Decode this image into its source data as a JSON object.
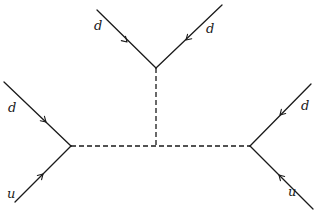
{
  "diagram": {
    "vertices": {
      "left": {
        "x": 71,
        "y": 146
      },
      "right": {
        "x": 250,
        "y": 146
      },
      "top": {
        "x": 156,
        "y": 68
      },
      "junction": {
        "x": 156,
        "y": 146
      }
    },
    "external_lines": [
      {
        "id": "left-upper",
        "label": "d",
        "from": [
          4,
          82
        ],
        "to": [
          71,
          146
        ],
        "label_pos": [
          8,
          112
        ],
        "arrow_at": [
          46,
          122
        ],
        "direction": "in"
      },
      {
        "id": "left-lower",
        "label": "u",
        "from": [
          15,
          202
        ],
        "to": [
          71,
          146
        ],
        "label_pos": [
          7,
          198
        ],
        "arrow_at": [
          43,
          174
        ],
        "direction": "in"
      },
      {
        "id": "top-left",
        "label": "d",
        "from": [
          97,
          10
        ],
        "to": [
          156,
          68
        ],
        "label_pos": [
          94,
          30
        ],
        "arrow_at": [
          127,
          42
        ],
        "direction": "in"
      },
      {
        "id": "top-right",
        "label": "d",
        "from": [
          222,
          5
        ],
        "to": [
          156,
          68
        ],
        "label_pos": [
          206,
          33
        ],
        "arrow_at": [
          186,
          40
        ],
        "direction": "in"
      },
      {
        "id": "right-upper",
        "label": "d",
        "from": [
          311,
          84
        ],
        "to": [
          250,
          146
        ],
        "label_pos": [
          301,
          110
        ],
        "arrow_at": [
          280,
          115
        ],
        "direction": "in"
      },
      {
        "id": "right-lower",
        "label": "u",
        "from": [
          313,
          209
        ],
        "to": [
          250,
          146
        ],
        "label_pos": [
          288,
          196
        ],
        "arrow_at": [
          279,
          175
        ],
        "direction": "in"
      }
    ],
    "internal_lines": [
      {
        "id": "horizontal-propagator",
        "from": [
          71,
          146
        ],
        "to": [
          250,
          146
        ],
        "style": "dashed"
      },
      {
        "id": "vertical-propagator",
        "from": [
          156,
          68
        ],
        "to": [
          156,
          146
        ],
        "style": "dashed"
      }
    ],
    "labels": [
      "d",
      "u",
      "d",
      "d",
      "d",
      "u"
    ],
    "colors": {
      "ink": "#1a1a1a",
      "background": "#ffffff"
    }
  }
}
